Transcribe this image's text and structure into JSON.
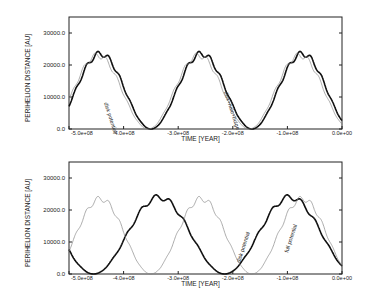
{
  "chart_data": [
    {
      "type": "line",
      "title": "",
      "xlabel": "TIME [YEAR]",
      "ylabel": "PERIHELION DISTANCE [AU]",
      "xlim": [
        -500000000.0,
        0.0
      ],
      "ylim": [
        0.0,
        35000.0
      ],
      "xticks": [
        "-5.0e+08",
        "-4.0e+08",
        "-3.0e+08",
        "-2.0e+08",
        "-1.0e+08",
        "0.0e+00"
      ],
      "yticks": [
        "0.0",
        "10000.0",
        "20000.0",
        "30000.0"
      ],
      "grid": false,
      "series": [
        {
          "name": "disk potential",
          "style": "thick black",
          "period": 185000000.0,
          "peak": 23500,
          "phase_min": -350000000.0
        },
        {
          "name": "disk+halo+bulge",
          "style": "thin grey",
          "period": 185000000.0,
          "peak": 23000,
          "phase_min": -355000000.0
        }
      ],
      "annotations": [
        "disk potential",
        "disk+halo+bulge"
      ]
    },
    {
      "type": "line",
      "title": "",
      "xlabel": "TIME [YEAR]",
      "ylabel": "PERIHELION DISTANCE [AU]",
      "xlim": [
        -500000000.0,
        0.0
      ],
      "ylim": [
        0.0,
        35000.0
      ],
      "xticks": [
        "-5.0e+08",
        "-4.0e+08",
        "-3.0e+08",
        "-2.0e+08",
        "-1.0e+08",
        "0.0e+00"
      ],
      "yticks": [
        "0.0",
        "10000.0",
        "20000.0",
        "30000.0"
      ],
      "grid": false,
      "series": [
        {
          "name": "full potential",
          "style": "thick black",
          "period": 240000000.0,
          "peak": 24000,
          "phase_min": -455000000.0
        },
        {
          "name": "disk potential",
          "style": "thin grey",
          "period": 185000000.0,
          "peak": 23500,
          "phase_min": -350000000.0
        }
      ],
      "annotations": [
        "full potential",
        "disk potential"
      ]
    }
  ],
  "panels": [
    {
      "xlabel": "TIME [YEAR]",
      "ylabel": "PERIHELION DISTANCE [AU]",
      "xticks": [
        "-5.0e+08",
        "-4.0e+08",
        "-3.0e+08",
        "-2.0e+08",
        "-1.0e+08",
        "0.0e+00"
      ],
      "yticks": [
        "0.0",
        "10000.0",
        "20000.0",
        "30000.0"
      ],
      "labels": [
        "disk potential",
        "disk+halo+bulge"
      ]
    },
    {
      "xlabel": "TIME [YEAR]",
      "ylabel": "PERIHELION DISTANCE [AU]",
      "xticks": [
        "-5.0e+08",
        "-4.0e+08",
        "-3.0e+08",
        "-2.0e+08",
        "-1.0e+08",
        "0.0e+00"
      ],
      "yticks": [
        "0.0",
        "10000.0",
        "20000.0",
        "30000.0"
      ],
      "labels": [
        "full potential",
        "disk potential"
      ]
    }
  ]
}
